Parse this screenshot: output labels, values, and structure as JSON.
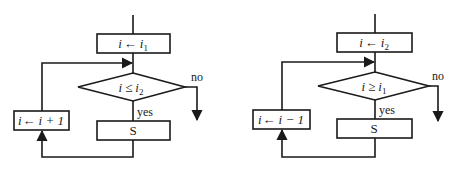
{
  "diagrams": [
    {
      "name": "ascending-loop",
      "init": {
        "var": "i",
        "arrow": "←",
        "value": "i",
        "sub": "1"
      },
      "condition": {
        "var": "i",
        "op": "≤",
        "value": "i",
        "sub": "2"
      },
      "body": "S",
      "update": {
        "text_var": "i",
        "arrow": "←",
        "expr": "i + 1"
      },
      "yes_label": "yes",
      "no_label": "no"
    },
    {
      "name": "descending-loop",
      "init": {
        "var": "i",
        "arrow": "←",
        "value": "i",
        "sub": "2"
      },
      "condition": {
        "var": "i",
        "op": "≥",
        "value": "i",
        "sub": "1"
      },
      "body": "S",
      "update": {
        "text_var": "i",
        "arrow": "←",
        "expr": "i − 1"
      },
      "yes_label": "yes",
      "no_label": "no"
    }
  ],
  "colors": {
    "stroke": "#1a1a1a",
    "background": "#ffffff"
  }
}
